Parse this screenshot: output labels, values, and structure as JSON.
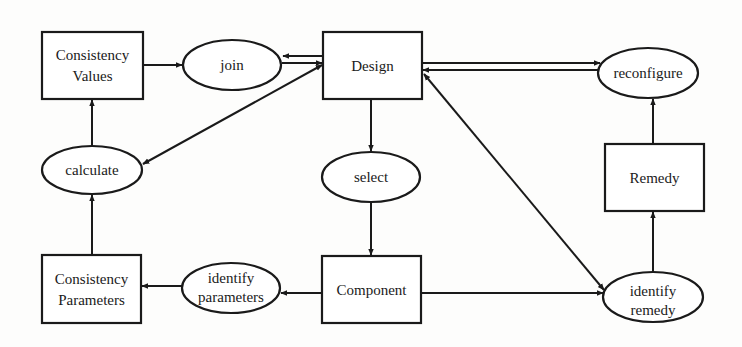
{
  "diagram": {
    "colors": {
      "stroke": "#1a1a1a",
      "background": "#fdfdfc",
      "text": "#1a1a1a"
    },
    "nodes": {
      "consistency_values": {
        "shape": "rect",
        "lines": [
          "Consistency",
          "Values"
        ]
      },
      "join": {
        "shape": "ellipse",
        "lines": [
          "join"
        ]
      },
      "design": {
        "shape": "rect",
        "lines": [
          "Design"
        ]
      },
      "reconfigure": {
        "shape": "ellipse",
        "lines": [
          "reconfigure"
        ]
      },
      "calculate": {
        "shape": "ellipse",
        "lines": [
          "calculate"
        ]
      },
      "select": {
        "shape": "ellipse",
        "lines": [
          "select"
        ]
      },
      "remedy": {
        "shape": "rect",
        "lines": [
          "Remedy"
        ]
      },
      "consistency_parameters": {
        "shape": "rect",
        "lines": [
          "Consistency",
          "Parameters"
        ]
      },
      "identify_parameters": {
        "shape": "ellipse",
        "lines": [
          "identify",
          "parameters"
        ]
      },
      "component": {
        "shape": "rect",
        "lines": [
          "Component"
        ]
      },
      "identify_remedy": {
        "shape": "ellipse",
        "lines": [
          "identify",
          "remedy"
        ]
      }
    },
    "edges": [
      {
        "from": "Consistency Values",
        "to": "join"
      },
      {
        "from": "join",
        "to": "Design"
      },
      {
        "from": "Design",
        "to": "join"
      },
      {
        "from": "Design",
        "to": "calculate"
      },
      {
        "from": "calculate",
        "to": "Consistency Values"
      },
      {
        "from": "Design",
        "to": "reconfigure"
      },
      {
        "from": "reconfigure",
        "to": "Design"
      },
      {
        "from": "Design",
        "to": "select"
      },
      {
        "from": "select",
        "to": "Component"
      },
      {
        "from": "Design",
        "to": "identify remedy"
      },
      {
        "from": "identify remedy",
        "to": "Design"
      },
      {
        "from": "Component",
        "to": "identify parameters"
      },
      {
        "from": "identify parameters",
        "to": "Consistency Parameters"
      },
      {
        "from": "Consistency Parameters",
        "to": "calculate"
      },
      {
        "from": "Component",
        "to": "identify remedy"
      },
      {
        "from": "identify remedy",
        "to": "Remedy"
      },
      {
        "from": "Remedy",
        "to": "reconfigure"
      }
    ]
  }
}
